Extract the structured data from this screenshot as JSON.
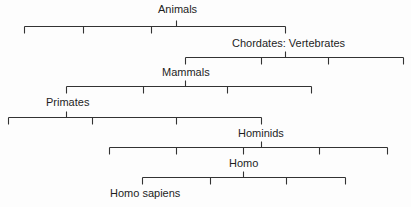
{
  "diagram": {
    "type": "taxonomic-hierarchy",
    "line_color": "#333333",
    "nodes": [
      {
        "id": "animals",
        "label": "Animals",
        "x": 176,
        "y": 8
      },
      {
        "id": "chordates",
        "label": "Chordates: Vertebrates",
        "x": 285,
        "y": 39
      },
      {
        "id": "mammals",
        "label": "Mammals",
        "x": 185,
        "y": 68
      },
      {
        "id": "primates",
        "label": "Primates",
        "x": 66,
        "y": 98
      },
      {
        "id": "hominids",
        "label": "Hominids",
        "x": 261,
        "y": 130
      },
      {
        "id": "homo",
        "label": "Homo",
        "x": 243,
        "y": 160
      },
      {
        "id": "homo_sapiens",
        "label": "Homo sapiens",
        "x": 142,
        "y": 190
      }
    ],
    "branches": [
      {
        "parent": "animals",
        "bar_y": 26,
        "x1": 24,
        "x2": 285,
        "stem_x": 176,
        "ticks": [
          24,
          83,
          151,
          285
        ]
      },
      {
        "parent": "chordates",
        "bar_y": 57,
        "x1": 185,
        "x2": 403,
        "stem_x": 285,
        "ticks": [
          185,
          261,
          328,
          403
        ]
      },
      {
        "parent": "mammals",
        "bar_y": 86,
        "x1": 66,
        "x2": 311,
        "stem_x": 185,
        "ticks": [
          66,
          143,
          227,
          311
        ]
      },
      {
        "parent": "primates",
        "bar_y": 117,
        "x1": 8,
        "x2": 261,
        "stem_x": 66,
        "ticks": [
          8,
          92,
          176,
          261
        ]
      },
      {
        "parent": "hominids",
        "bar_y": 147,
        "x1": 109,
        "x2": 387,
        "stem_x": 261,
        "ticks": [
          109,
          176,
          243,
          319,
          387
        ]
      },
      {
        "parent": "homo",
        "bar_y": 177,
        "x1": 142,
        "x2": 345,
        "stem_x": 243,
        "ticks": [
          142,
          210,
          286,
          345
        ]
      }
    ]
  }
}
